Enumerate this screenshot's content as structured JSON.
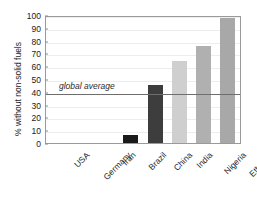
{
  "chart_data": {
    "type": "bar",
    "title": "",
    "xlabel": "",
    "ylabel": "% without non-solid fuels",
    "categories": [
      "USA",
      "Germany",
      "Iran",
      "Brazil",
      "China",
      "India",
      "Nigeria",
      "Ethiopia"
    ],
    "values": [
      0,
      0,
      0,
      6,
      45,
      64,
      76,
      98
    ],
    "bar_colors": [
      "#bdbdbd",
      "#bdbdbd",
      "#bdbdbd",
      "#1a1a1a",
      "#3d3d3d",
      "#cfcfcf",
      "#b0b0b0",
      "#a8a8a8"
    ],
    "ylim": [
      0,
      100
    ],
    "yticks": [
      0,
      10,
      20,
      30,
      40,
      50,
      60,
      70,
      80,
      90,
      100
    ],
    "ytick_labels": [
      "0",
      "10",
      "20",
      "30",
      "40",
      "50",
      "60",
      "70",
      "80",
      "90",
      "100"
    ],
    "grid": true,
    "legend": "none",
    "annotations": [
      {
        "name": "global-average",
        "label": "global average",
        "value": 40,
        "kind": "horizontal-line",
        "color": "#6e6e6e"
      }
    ]
  },
  "colors": {
    "frame": "#9a9a9a",
    "grid": "#ededed",
    "text": "#1a1a1a",
    "average_line": "#6e6e6e",
    "background": "#ffffff"
  }
}
